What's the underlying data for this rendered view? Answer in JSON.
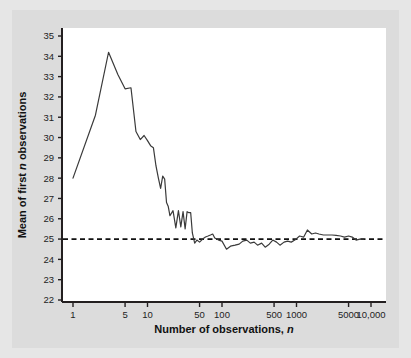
{
  "figure": {
    "background_color": "#e6e6e6",
    "mat_color": "#dcdcdc",
    "plot_background_color": "#ffffff",
    "axis_color": "#231f20",
    "series_color": "#3a3a3a",
    "reference_line_color": "#111111"
  },
  "axis_titles": {
    "x_prefix": "Number of observations, ",
    "x_italic": "n",
    "y_prefix": "Mean of first ",
    "y_italic": "n",
    "y_suffix": " observations"
  },
  "chart_data": {
    "type": "line",
    "title": "",
    "subtitle": "",
    "xlabel": "Number of observations, n",
    "ylabel": "Mean of first n observations",
    "xscale": "log",
    "yscale": "linear",
    "xlim": [
      1,
      10000
    ],
    "ylim": [
      22,
      35
    ],
    "grid": false,
    "legend": false,
    "legend_position": "none",
    "x_tick_values": [
      1,
      5,
      10,
      50,
      100,
      500,
      1000,
      5000,
      10000
    ],
    "x_tick_labels": [
      "1",
      "5",
      "10",
      "50",
      "100",
      "500",
      "1000",
      "5000",
      "10,000"
    ],
    "y_tick_values": [
      22,
      23,
      24,
      25,
      26,
      27,
      28,
      29,
      30,
      31,
      32,
      33,
      34,
      35
    ],
    "y_tick_labels": [
      "22",
      "23",
      "24",
      "25",
      "26",
      "27",
      "28",
      "29",
      "30",
      "31",
      "32",
      "33",
      "34",
      "35"
    ],
    "annotations": [
      {
        "kind": "reference-line",
        "orientation": "horizontal",
        "value": 25,
        "style": "dashed",
        "label": ""
      }
    ],
    "series": [
      {
        "name": "Running mean of first n observations",
        "style": "solid",
        "x": [
          1,
          2,
          3,
          4,
          5,
          6,
          7,
          8,
          9,
          10,
          11,
          12,
          13,
          14,
          15,
          16,
          17,
          18,
          19,
          20,
          22,
          24,
          26,
          28,
          30,
          32,
          34,
          36,
          38,
          40,
          43,
          46,
          50,
          55,
          60,
          65,
          70,
          75,
          80,
          90,
          100,
          115,
          130,
          150,
          170,
          190,
          215,
          240,
          270,
          300,
          340,
          380,
          430,
          480,
          540,
          600,
          680,
          760,
          850,
          950,
          1100,
          1250,
          1400,
          1600,
          1800,
          2000,
          2300,
          2600,
          3000,
          3400,
          3900,
          4400,
          5000,
          5600,
          6300,
          7100,
          8000
        ],
        "y": [
          28.0,
          31.1,
          34.2,
          33.1,
          32.4,
          32.45,
          30.3,
          29.9,
          30.1,
          29.85,
          29.6,
          29.5,
          28.6,
          28.0,
          27.5,
          28.1,
          27.95,
          26.8,
          26.6,
          26.15,
          26.4,
          25.55,
          26.4,
          25.6,
          26.35,
          25.5,
          26.35,
          26.3,
          26.3,
          25.3,
          24.8,
          24.95,
          24.85,
          25.0,
          25.1,
          25.15,
          25.2,
          25.25,
          25.05,
          24.95,
          24.9,
          24.5,
          24.65,
          24.7,
          24.75,
          24.9,
          24.95,
          24.8,
          24.85,
          24.7,
          24.8,
          24.6,
          24.75,
          24.95,
          24.85,
          24.7,
          24.85,
          24.9,
          24.85,
          24.95,
          25.15,
          25.1,
          25.45,
          25.25,
          25.3,
          25.25,
          25.2,
          25.2,
          25.2,
          25.18,
          25.15,
          25.1,
          25.15,
          25.1,
          24.95,
          25.0,
          25.0
        ]
      }
    ]
  }
}
